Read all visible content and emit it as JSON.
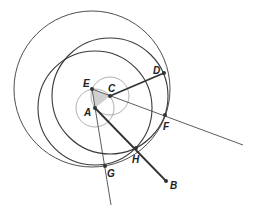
{
  "diagram": {
    "type": "geometric-construction",
    "colors": {
      "stroke": "#3a3a3a",
      "thin": "#9a9a9a",
      "fill_triangle": "#d0d0d0",
      "point": "#333333"
    },
    "points": {
      "A": {
        "x": 95,
        "y": 108,
        "label": "A"
      },
      "B": {
        "x": 166,
        "y": 181,
        "label": "B"
      },
      "C": {
        "x": 110,
        "y": 96,
        "label": "C"
      },
      "D": {
        "x": 164,
        "y": 73,
        "label": "D"
      },
      "E": {
        "x": 92,
        "y": 89,
        "label": "E"
      },
      "F": {
        "x": 165,
        "y": 115,
        "label": "F"
      },
      "G": {
        "x": 105,
        "y": 166,
        "label": "G"
      },
      "H": {
        "x": 136,
        "y": 148,
        "label": "H"
      }
    },
    "circles": [
      {
        "name": "small-circle-A",
        "cx": 95,
        "cy": 108,
        "r": 19
      },
      {
        "name": "small-circle-E",
        "cx": 110,
        "cy": 96,
        "r": 19
      },
      {
        "name": "circle-C-through-D",
        "cx": 110,
        "cy": 96,
        "r": 58
      },
      {
        "name": "circle-E-through-F",
        "cx": 92,
        "cy": 89,
        "r": 78
      },
      {
        "name": "circle-A-through-H",
        "cx": 95,
        "cy": 108,
        "r": 57
      }
    ],
    "segments": [
      {
        "name": "line-EF-extended",
        "from": "E",
        "to_xy": [
          243,
          145
        ]
      },
      {
        "name": "line-EG-extended",
        "from": "E",
        "to_xy": [
          111,
          205
        ]
      },
      {
        "name": "segment-CD",
        "from": "C",
        "to": "D"
      },
      {
        "name": "segment-AB",
        "from": "A",
        "to": "B"
      }
    ],
    "shaded_triangle": [
      "A",
      "E",
      "C"
    ]
  }
}
